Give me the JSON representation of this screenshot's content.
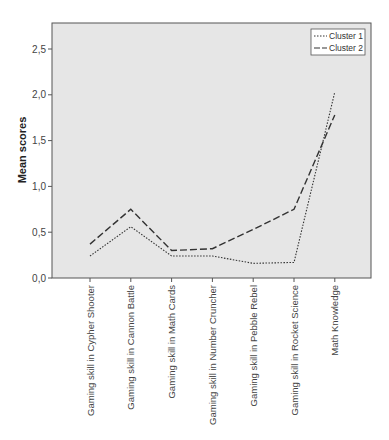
{
  "chart_data": {
    "type": "line",
    "title": "",
    "xlabel": "",
    "ylabel": "Mean scores",
    "ylim": [
      0,
      2.75
    ],
    "yticks": [
      0.0,
      0.5,
      1.0,
      1.5,
      2.0,
      2.5
    ],
    "ytick_labels": [
      "0,0",
      "0,5",
      "1,0",
      "1,5",
      "2,0",
      "2,5"
    ],
    "grid": false,
    "legend_position": "top-right",
    "categories": [
      "Gaming skill in Cypher Shooter",
      "Gaming skill in Cannon Battle",
      "Gaming skill in Math Cards",
      "Gaming skill in Number Cruncher",
      "Gaming skill in Pebble Rebel",
      "Gaming skill in Rocket Science",
      "Math Knowledge"
    ],
    "series": [
      {
        "name": "Cluster 1",
        "style": "dotted",
        "values": [
          0.24,
          0.56,
          0.24,
          0.24,
          0.16,
          0.17,
          2.03
        ]
      },
      {
        "name": "Cluster 2",
        "style": "dashed",
        "values": [
          0.37,
          0.75,
          0.3,
          0.32,
          0.53,
          0.75,
          1.78
        ]
      }
    ]
  },
  "colors": {
    "plot_background": "#e6e6e6",
    "line": "#333333",
    "frame": "#555555"
  }
}
